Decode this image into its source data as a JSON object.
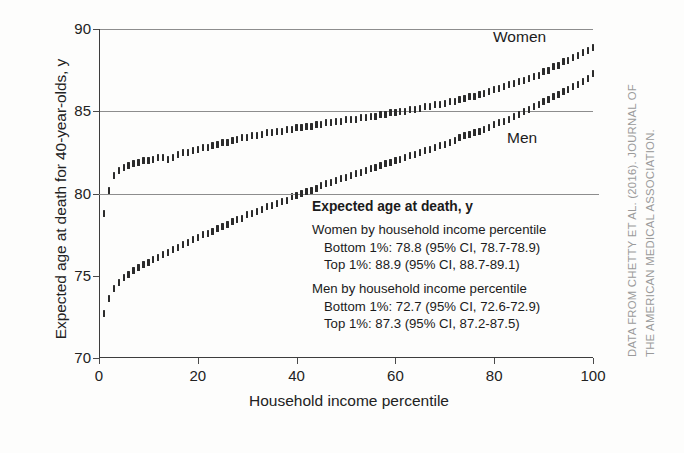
{
  "figure": {
    "credit_line_1": "DATA FROM CHETTY ET AL. (2016). JOURNAL OF",
    "credit_line_2": "THE AMERICAN MEDICAL ASSOCIATION."
  },
  "annotation": {
    "title": "Expected age at death, y",
    "women_header": "Women by household income percentile",
    "women_bottom": "Bottom 1%: 78.8 (95% CI, 78.7-78.9)",
    "women_top": "Top 1%: 88.9 (95% CI, 88.7-89.1)",
    "men_header": "Men by household income percentile",
    "men_bottom": "Bottom 1%: 72.7 (95% CI, 72.6-72.9)",
    "men_top": "Top 1%: 87.3 (95% CI, 87.2-87.5)"
  },
  "chart_data": {
    "type": "scatter",
    "title": "",
    "xlabel": "Household income percentile",
    "ylabel": "Expected age at death for 40-year-olds, y",
    "xlim": [
      0,
      100
    ],
    "ylim": [
      70,
      90
    ],
    "xticks": [
      0,
      20,
      40,
      60,
      80,
      100
    ],
    "yticks": [
      70,
      75,
      80,
      85,
      90
    ],
    "gridlines": [
      80,
      85,
      90
    ],
    "grid": true,
    "legend_position": "inline-annotation",
    "marker_style": "vertical-error-bar",
    "series": [
      {
        "name": "Women",
        "label": "Women",
        "color": "#2b2b2b",
        "x": [
          1,
          2,
          3,
          4,
          5,
          6,
          7,
          8,
          9,
          10,
          11,
          12,
          13,
          14,
          15,
          16,
          17,
          18,
          19,
          20,
          21,
          22,
          23,
          24,
          25,
          26,
          27,
          28,
          29,
          30,
          31,
          32,
          33,
          34,
          35,
          36,
          37,
          38,
          39,
          40,
          41,
          42,
          43,
          44,
          45,
          46,
          47,
          48,
          49,
          50,
          51,
          52,
          53,
          54,
          55,
          56,
          57,
          58,
          59,
          60,
          61,
          62,
          63,
          64,
          65,
          66,
          67,
          68,
          69,
          70,
          71,
          72,
          73,
          74,
          75,
          76,
          77,
          78,
          79,
          80,
          81,
          82,
          83,
          84,
          85,
          86,
          87,
          88,
          89,
          90,
          91,
          92,
          93,
          94,
          95,
          96,
          97,
          98,
          99,
          100
        ],
        "y": [
          78.8,
          80.2,
          81.1,
          81.4,
          81.6,
          81.7,
          81.8,
          81.9,
          82.0,
          82.0,
          82.1,
          82.2,
          82.2,
          82.1,
          82.2,
          82.4,
          82.5,
          82.5,
          82.6,
          82.7,
          82.8,
          82.8,
          82.9,
          83.0,
          83.1,
          83.1,
          83.2,
          83.3,
          83.4,
          83.4,
          83.5,
          83.5,
          83.6,
          83.7,
          83.7,
          83.8,
          83.8,
          83.9,
          83.9,
          84.0,
          84.0,
          84.1,
          84.1,
          84.2,
          84.2,
          84.3,
          84.3,
          84.4,
          84.4,
          84.5,
          84.5,
          84.5,
          84.6,
          84.6,
          84.7,
          84.7,
          84.8,
          84.8,
          84.9,
          84.9,
          85.0,
          85.0,
          85.1,
          85.1,
          85.2,
          85.3,
          85.3,
          85.4,
          85.4,
          85.5,
          85.6,
          85.6,
          85.7,
          85.8,
          85.9,
          85.9,
          86.0,
          86.1,
          86.2,
          86.3,
          86.4,
          86.5,
          86.6,
          86.7,
          86.8,
          86.9,
          87.0,
          87.1,
          87.2,
          87.4,
          87.5,
          87.7,
          87.8,
          88.0,
          88.1,
          88.3,
          88.4,
          88.6,
          88.7,
          88.9
        ],
        "bottom_1pct": 78.8,
        "bottom_1pct_ci": [
          78.7,
          78.9
        ],
        "top_1pct": 88.9,
        "top_1pct_ci": [
          88.7,
          89.1
        ]
      },
      {
        "name": "Men",
        "label": "Men",
        "color": "#2b2b2b",
        "x": [
          1,
          2,
          3,
          4,
          5,
          6,
          7,
          8,
          9,
          10,
          11,
          12,
          13,
          14,
          15,
          16,
          17,
          18,
          19,
          20,
          21,
          22,
          23,
          24,
          25,
          26,
          27,
          28,
          29,
          30,
          31,
          32,
          33,
          34,
          35,
          36,
          37,
          38,
          39,
          40,
          41,
          42,
          43,
          44,
          45,
          46,
          47,
          48,
          49,
          50,
          51,
          52,
          53,
          54,
          55,
          56,
          57,
          58,
          59,
          60,
          61,
          62,
          63,
          64,
          65,
          66,
          67,
          68,
          69,
          70,
          71,
          72,
          73,
          74,
          75,
          76,
          77,
          78,
          79,
          80,
          81,
          82,
          83,
          84,
          85,
          86,
          87,
          88,
          89,
          90,
          91,
          92,
          93,
          94,
          95,
          96,
          97,
          98,
          99,
          100
        ],
        "y": [
          72.7,
          73.6,
          74.2,
          74.6,
          74.9,
          75.1,
          75.3,
          75.5,
          75.7,
          75.8,
          76.0,
          76.1,
          76.3,
          76.4,
          76.6,
          76.7,
          76.9,
          77.0,
          77.2,
          77.3,
          77.5,
          77.6,
          77.7,
          77.9,
          78.0,
          78.1,
          78.3,
          78.4,
          78.5,
          78.7,
          78.8,
          78.9,
          79.0,
          79.2,
          79.3,
          79.4,
          79.5,
          79.6,
          79.8,
          79.9,
          80.0,
          80.1,
          80.2,
          80.3,
          80.5,
          80.6,
          80.7,
          80.8,
          80.9,
          81.0,
          81.1,
          81.2,
          81.3,
          81.4,
          81.5,
          81.6,
          81.7,
          81.8,
          81.9,
          82.0,
          82.1,
          82.2,
          82.3,
          82.4,
          82.5,
          82.6,
          82.7,
          82.8,
          82.9,
          83.0,
          83.1,
          83.2,
          83.4,
          83.5,
          83.6,
          83.7,
          83.8,
          83.9,
          84.0,
          84.2,
          84.3,
          84.4,
          84.5,
          84.7,
          84.8,
          85.0,
          85.1,
          85.3,
          85.4,
          85.6,
          85.7,
          85.9,
          86.0,
          86.2,
          86.3,
          86.5,
          86.6,
          86.8,
          87.0,
          87.3
        ],
        "bottom_1pct": 72.7,
        "bottom_1pct_ci": [
          72.6,
          72.9
        ],
        "top_1pct": 87.3,
        "top_1pct_ci": [
          87.2,
          87.5
        ]
      }
    ]
  }
}
